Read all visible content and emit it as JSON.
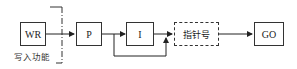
{
  "diagram": {
    "nodes": [
      {
        "id": "wr",
        "label": "WR",
        "style": "solid"
      },
      {
        "id": "p",
        "label": "P",
        "style": "solid"
      },
      {
        "id": "i",
        "label": "I",
        "style": "solid"
      },
      {
        "id": "ptr",
        "label": "指针号",
        "style": "dashed"
      },
      {
        "id": "go",
        "label": "GO",
        "style": "solid"
      }
    ],
    "edges": [
      {
        "from": "wr",
        "to": "p"
      },
      {
        "from": "p",
        "to": "i"
      },
      {
        "from": "p",
        "to": "ptr",
        "note": "bypass below I"
      },
      {
        "from": "i",
        "to": "ptr"
      },
      {
        "from": "ptr",
        "to": "go"
      }
    ],
    "annotations": {
      "write_function": "写入功能"
    }
  }
}
